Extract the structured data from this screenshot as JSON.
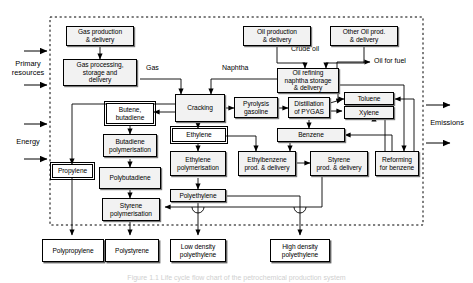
{
  "figure": {
    "caption": "Figure 1.1 Life cycle flow chart of the petrochemical production system",
    "system_boundary": "dashed boundary enclosing the production system"
  },
  "inputs": {
    "primary_resources": {
      "label": "Primary\nresources",
      "line1": "Primary",
      "line2": "resources",
      "arrows": 2
    },
    "energy": {
      "label": "Energy",
      "arrows": 2
    }
  },
  "outputs": {
    "emissions": {
      "label": "Emissions",
      "arrows": 2
    }
  },
  "edge_labels": [
    {
      "id": "gas",
      "text": "Gas"
    },
    {
      "id": "naphtha",
      "text": "Naphtha"
    },
    {
      "id": "crude-oil",
      "text": "Crude oil"
    },
    {
      "id": "oil-for-fuel",
      "text": "Oil for fuel"
    }
  ],
  "nodes": {
    "gas_production": "Gas production\n& delivery",
    "gas_production_l1": "Gas production",
    "gas_production_l2": "& delivery",
    "gas_processing_l1": "Gas processing,",
    "gas_processing_l2": "storage and",
    "gas_processing_l3": "delivery",
    "oil_production_l1": "Oil production",
    "oil_production_l2": "& delivery",
    "other_oil_l1": "Other Oil prod.",
    "other_oil_l2": "& delivery",
    "oil_refining_l1": "Oil refining",
    "oil_refining_l2": "naphtha storage",
    "oil_refining_l3": "& delivery",
    "cracking": "Cracking",
    "pyrolysis_l1": "Pyrolysis",
    "pyrolysis_l2": "gasoline",
    "distillation_l1": "Distillation",
    "distillation_l2": "of PYGAS",
    "toluene": "Toluene",
    "xylene": "Xylene",
    "benzene": "Benzene",
    "butene_l1": "Butene,",
    "butene_l2": "butadiene",
    "ethylene": "Ethylene",
    "butadiene_poly_l1": "Butadiene",
    "butadiene_poly_l2": "polymerisation",
    "ethylene_poly_l1": "Ethylene",
    "ethylene_poly_l2": "polymerisation",
    "ethylbenzene_l1": "Ethylbenzene",
    "ethylbenzene_l2": "prod. & delivery",
    "styrene_prod_l1": "Styrene",
    "styrene_prod_l2": "prod. & delivery",
    "reforming_l1": "Reforming",
    "reforming_l2": "for benzene",
    "propylene": "Propylene",
    "polybutadiene": "Polybutadiene",
    "polyethylene": "Polyethylene",
    "styrene_poly_l1": "Styrene",
    "styrene_poly_l2": "polymerisation"
  },
  "products": {
    "polypropylene": "Polypropylene",
    "polystyrene": "Polystyrene",
    "ldpe_l1": "Low density",
    "ldpe_l2": "polyethylene",
    "hdpe_l1": "High density",
    "hdpe_l2": "polyethylene"
  },
  "colors": {
    "node_fill": "#f2f2f2",
    "product_fill": "#ffffff",
    "stroke": "#000000",
    "shadow": "#777777",
    "background": "#ffffff"
  }
}
